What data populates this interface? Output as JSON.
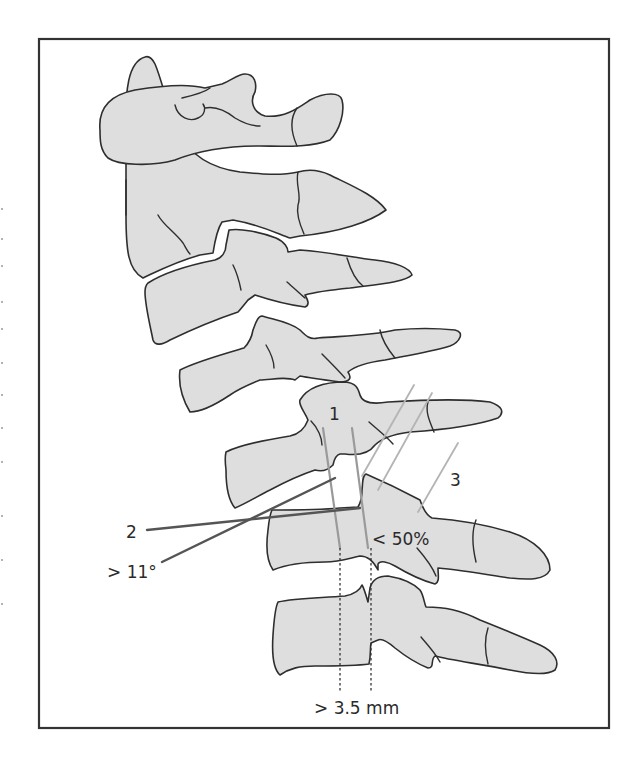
{
  "figure": {
    "type": "lateral cervical spine line drawing",
    "colors": {
      "bone_fill": "#dedede",
      "outline": "#2e2e2e",
      "frame": "#333333",
      "measurement_line_gray": "#9a9a9a",
      "measurement_line_light": "#b4b4b4",
      "measurement_line_dark": "#555555"
    }
  },
  "labels": {
    "line_1": "1",
    "line_2": "2",
    "line_3": "3",
    "angle": "> 11°",
    "translation_percent": "< 50%",
    "translation_distance": "> 3.5 mm"
  },
  "structures": [
    "occiput",
    "C1 (atlas)",
    "C2 (axis)",
    "C3",
    "C4",
    "C5",
    "C6",
    "C7"
  ]
}
